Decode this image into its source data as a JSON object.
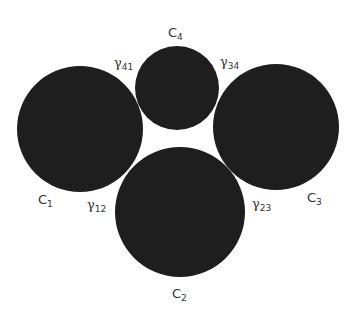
{
  "diagram": {
    "type": "tangent-circles",
    "colors": {
      "circle_fill": "#1e1e1e",
      "background": "#ffffff",
      "label": "#333333"
    },
    "circles": [
      {
        "id": "C1",
        "label": "C",
        "subscript": "1",
        "cx": 80,
        "cy": 129,
        "r": 63
      },
      {
        "id": "C2",
        "label": "C",
        "subscript": "2",
        "cx": 180,
        "cy": 212,
        "r": 65
      },
      {
        "id": "C3",
        "label": "C",
        "subscript": "3",
        "cx": 276,
        "cy": 127,
        "r": 63
      },
      {
        "id": "C4",
        "label": "C",
        "subscript": "4",
        "cx": 177,
        "cy": 88,
        "r": 42
      }
    ],
    "contact_labels": [
      {
        "id": "gamma41",
        "symbol": "γ",
        "subscript": "41"
      },
      {
        "id": "gamma34",
        "symbol": "γ",
        "subscript": "34"
      },
      {
        "id": "gamma12",
        "symbol": "γ",
        "subscript": "12"
      },
      {
        "id": "gamma23",
        "symbol": "γ",
        "subscript": "23"
      }
    ]
  }
}
